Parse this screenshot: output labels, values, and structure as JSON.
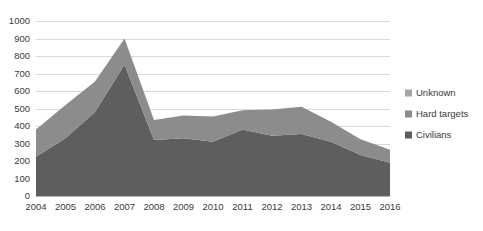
{
  "chart_data": {
    "type": "area",
    "stacked": true,
    "title": "",
    "subtitle": "",
    "xlabel": "",
    "ylabel": "",
    "categories": [
      "2004",
      "2005",
      "2006",
      "2007",
      "2008",
      "2009",
      "2010",
      "2011",
      "2012",
      "2013",
      "2014",
      "2015",
      "2016"
    ],
    "series": [
      {
        "name": "Civilians",
        "color": "#5e5e5e",
        "values": [
          225,
          330,
          480,
          750,
          320,
          330,
          310,
          380,
          345,
          355,
          310,
          235,
          190
        ]
      },
      {
        "name": "Hard targets",
        "color": "#8c8c8c",
        "values": [
          155,
          190,
          175,
          150,
          115,
          130,
          145,
          110,
          150,
          155,
          115,
          90,
          75
        ]
      },
      {
        "name": "Unknown",
        "color": "#a6a6a6",
        "values": [
          0,
          0,
          0,
          0,
          0,
          0,
          0,
          0,
          0,
          0,
          0,
          0,
          0
        ]
      }
    ],
    "totals": [
      380,
      520,
      655,
      900,
      435,
      460,
      455,
      490,
      495,
      510,
      425,
      325,
      265
    ],
    "ylim": [
      0,
      1000
    ],
    "y_ticks": [
      0,
      100,
      200,
      300,
      400,
      500,
      600,
      700,
      800,
      900,
      1000
    ],
    "y_tick_labels": [
      "0",
      "100",
      "200",
      "300",
      "400",
      "500",
      "600",
      "700",
      "800",
      "900",
      "1000"
    ],
    "grid": true,
    "legend_position": "right",
    "legend": [
      {
        "label": "Unknown",
        "color": "#a6a6a6"
      },
      {
        "label": "Hard targets",
        "color": "#8c8c8c"
      },
      {
        "label": "Civilians",
        "color": "#5e5e5e"
      }
    ]
  },
  "colors": {
    "gridline": "#d9d9d9",
    "axis": "#b3b3b3",
    "text": "#3a3a3a",
    "background": "#ffffff"
  }
}
